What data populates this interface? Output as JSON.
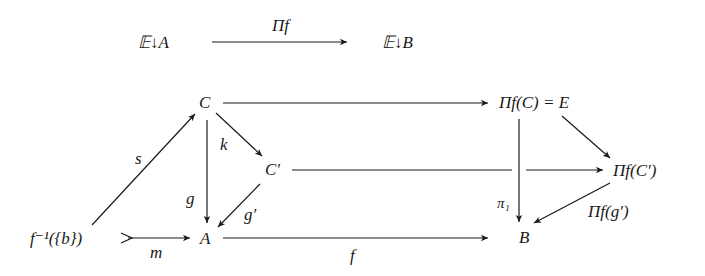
{
  "diagram": {
    "top_row": {
      "left_object": "𝔼↓A",
      "right_object": "𝔼↓B",
      "functor_label": "Π_f",
      "functor_display": "Πf"
    },
    "nodes": {
      "C": "C",
      "C_prime": "C′",
      "A": "A",
      "fiber": "f⁻¹({b})",
      "B": "B",
      "Pi_C": "Πf(C) = E",
      "Pi_C_prime": "Πf(C′)"
    },
    "arrows": [
      {
        "from": "fiber",
        "to": "C",
        "label": "s"
      },
      {
        "from": "fiber",
        "to": "A",
        "label": "m",
        "style": "mono"
      },
      {
        "from": "C",
        "to": "C_prime",
        "label": "k"
      },
      {
        "from": "C",
        "to": "A",
        "label": "g"
      },
      {
        "from": "C_prime",
        "to": "A",
        "label": "g′"
      },
      {
        "from": "A",
        "to": "B",
        "label": "f"
      },
      {
        "from": "C",
        "to": "Pi_C",
        "label": ""
      },
      {
        "from": "C_prime",
        "to": "Pi_C_prime",
        "label": ""
      },
      {
        "from": "Pi_C",
        "to": "Pi_C_prime",
        "label": ""
      },
      {
        "from": "Pi_C",
        "to": "B",
        "label": "π₁"
      },
      {
        "from": "Pi_C_prime",
        "to": "B",
        "label": "Πf(g′)"
      }
    ],
    "labels": {
      "s": "s",
      "m": "m",
      "k": "k",
      "g": "g",
      "g_prime": "g′",
      "f": "f",
      "pi1": "π₁",
      "Pi_g_prime": "Πf(g′)"
    }
  }
}
